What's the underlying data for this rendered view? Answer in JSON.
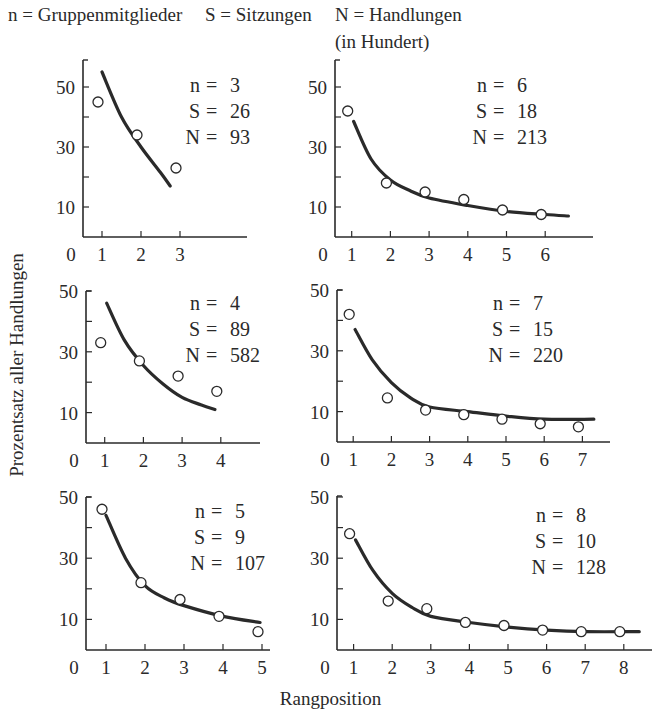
{
  "legend": {
    "n_def": "n = Gruppenmitglieder",
    "s_def": "S = Sitzungen",
    "N_def": "N = Handlungen",
    "N_unit": "(in Hundert)"
  },
  "axes": {
    "ylabel": "Prozentsatz aller Handlungen",
    "xlabel": "Rangposition"
  },
  "chart_data": [
    {
      "type": "scatter",
      "panel": "row1-left",
      "title": "n = 3, S = 26, N = 93",
      "annotations": [
        "n = 3",
        "S = 26",
        "N = 93"
      ],
      "x": [
        1,
        2,
        3
      ],
      "values": [
        45,
        34,
        23
      ],
      "fit_curve": {
        "x": [
          1.0,
          1.5,
          2.0,
          2.5,
          2.75
        ],
        "y": [
          55,
          40,
          30,
          21.5,
          17
        ]
      },
      "xlabel": "Rangposition",
      "ylabel": "Prozentsatz aller Handlungen",
      "yticks": [
        10,
        30,
        50
      ],
      "xticks": [
        0,
        1,
        2,
        3
      ],
      "ylim": [
        0,
        58
      ]
    },
    {
      "type": "scatter",
      "panel": "row1-right",
      "title": "n = 6, S = 18, N = 213",
      "annotations": [
        "n = 6",
        "S = 18",
        "N = 213"
      ],
      "x": [
        1,
        2,
        3,
        4,
        5,
        6
      ],
      "values": [
        42,
        18,
        15,
        12.5,
        9,
        7.5
      ],
      "fit_curve": {
        "x": [
          1.05,
          1.5,
          2.0,
          2.5,
          3.0,
          4.0,
          5.0,
          6.0,
          6.6
        ],
        "y": [
          38.5,
          26,
          19,
          15.5,
          13,
          10.5,
          8.5,
          7.5,
          7
        ]
      },
      "xlabel": "Rangposition",
      "ylabel": "Prozentsatz aller Handlungen",
      "yticks": [
        10,
        30,
        50
      ],
      "xticks": [
        0,
        1,
        2,
        3,
        4,
        5,
        6
      ],
      "ylim": [
        0,
        58
      ]
    },
    {
      "type": "scatter",
      "panel": "row2-left",
      "title": "n = 4, S = 89, N = 582",
      "annotations": [
        "n = 4",
        "S = 89",
        "N = 582"
      ],
      "x": [
        1,
        2,
        3,
        4
      ],
      "values": [
        33,
        27,
        22,
        17
      ],
      "fit_curve": {
        "x": [
          1.05,
          1.5,
          2.0,
          2.5,
          3.0,
          3.5,
          3.85
        ],
        "y": [
          46,
          34,
          25.5,
          19.5,
          15,
          12.5,
          11
        ]
      },
      "xlabel": "Rangposition",
      "ylabel": "Prozentsatz aller Handlungen",
      "yticks": [
        10,
        30,
        50
      ],
      "xticks": [
        0,
        1,
        2,
        3,
        4
      ],
      "ylim": [
        0,
        50
      ]
    },
    {
      "type": "scatter",
      "panel": "row2-right",
      "title": "n = 7, S = 15, N = 220",
      "annotations": [
        "n = 7",
        "S = 15",
        "N = 220"
      ],
      "x": [
        1,
        2,
        3,
        4,
        5,
        6,
        7
      ],
      "values": [
        42,
        14.5,
        10.5,
        9,
        7.5,
        6,
        5
      ],
      "fit_curve": {
        "x": [
          1.05,
          1.5,
          2.0,
          2.5,
          3.0,
          4.0,
          5.0,
          6.0,
          7.3
        ],
        "y": [
          37,
          27,
          19.5,
          14.5,
          11.5,
          10,
          8.5,
          7.5,
          7.5
        ]
      },
      "xlabel": "Rangposition",
      "ylabel": "Prozentsatz aller Handlungen",
      "yticks": [
        10,
        30,
        50
      ],
      "xticks": [
        0,
        1,
        2,
        3,
        4,
        5,
        6,
        7
      ],
      "ylim": [
        0,
        50
      ]
    },
    {
      "type": "scatter",
      "panel": "row3-left",
      "title": "n = 5, S = 9, N = 107",
      "annotations": [
        "n = 5",
        "S = 9",
        "N = 107"
      ],
      "x": [
        1,
        2,
        3,
        4,
        5
      ],
      "values": [
        46,
        22,
        16.5,
        11,
        6
      ],
      "fit_curve": {
        "x": [
          1.0,
          1.5,
          2.0,
          2.5,
          3.0,
          4.0,
          4.95
        ],
        "y": [
          44,
          30,
          21,
          17,
          14.5,
          11,
          9
        ]
      },
      "xlabel": "Rangposition",
      "ylabel": "Prozentsatz aller Handlungen",
      "yticks": [
        10,
        30,
        50
      ],
      "xticks": [
        0,
        1,
        2,
        3,
        4,
        5
      ],
      "ylim": [
        0,
        50
      ]
    },
    {
      "type": "scatter",
      "panel": "row3-right",
      "title": "n = 8, S = 10, N = 128",
      "annotations": [
        "n = 8",
        "S = 10",
        "N = 128"
      ],
      "x": [
        1,
        2,
        3,
        4,
        5,
        6,
        7,
        8
      ],
      "values": [
        38,
        16,
        13.5,
        9,
        8,
        6.5,
        6,
        6
      ],
      "fit_curve": {
        "x": [
          1.05,
          1.5,
          2.0,
          2.5,
          3.0,
          4.0,
          5.0,
          6.0,
          7.0,
          8.4
        ],
        "y": [
          36,
          26,
          18.5,
          14,
          11,
          9,
          7.5,
          6.5,
          6,
          6
        ]
      },
      "xlabel": "Rangposition",
      "ylabel": "Prozentsatz aller Handlungen",
      "yticks": [
        10,
        30,
        50
      ],
      "xticks": [
        0,
        1,
        2,
        3,
        4,
        5,
        6,
        7,
        8
      ],
      "ylim": [
        0,
        50
      ]
    }
  ],
  "layout": {
    "panels": [
      {
        "ax_x": 83,
        "ax_y": 237,
        "y_top": 60,
        "x_end": 247,
        "x0": 63,
        "dx": 39,
        "y10": 30.0
      },
      {
        "ax_x": 335,
        "ax_y": 237,
        "y_top": 60,
        "x_end": 593,
        "x0": 313,
        "dx": 38.7,
        "y10": 30.0
      },
      {
        "ax_x": 86,
        "ax_y": 443,
        "y_top": 291,
        "x_end": 260,
        "x0": 66,
        "dx": 38.7,
        "y10": 30.4
      },
      {
        "ax_x": 337,
        "ax_y": 442,
        "y_top": 290,
        "x_end": 610,
        "x0": 315,
        "dx": 38.2,
        "y10": 30.4
      },
      {
        "ax_x": 86,
        "ax_y": 650,
        "y_top": 497,
        "x_end": 270,
        "x0": 67,
        "dx": 39,
        "y10": 30.6
      },
      {
        "ax_x": 337,
        "ax_y": 650,
        "y_top": 496,
        "x_end": 652,
        "x0": 315,
        "dx": 38.6,
        "y10": 30.6
      }
    ],
    "annot_pos": [
      {
        "x": 200,
        "y": 92
      },
      {
        "x": 487,
        "y": 92
      },
      {
        "x": 200,
        "y": 310
      },
      {
        "x": 503,
        "y": 310
      },
      {
        "x": 205,
        "y": 518
      },
      {
        "x": 546,
        "y": 522
      }
    ]
  }
}
